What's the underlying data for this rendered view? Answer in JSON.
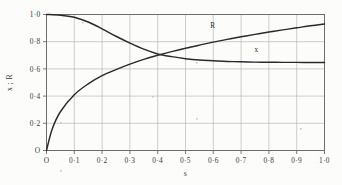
{
  "chart_data": {
    "type": "line",
    "title": "",
    "xlabel": "s",
    "ylabel": "x ; R",
    "xlim": [
      0,
      1.0
    ],
    "ylim": [
      0,
      1.0
    ],
    "grid": true,
    "legend": "inline-curve-labels",
    "x_tick_labels": [
      "O",
      "0·1",
      "0·2",
      "0·3",
      "0·4",
      "0·5",
      "0·6",
      "0·7",
      "0·8",
      "0·9",
      "1·0"
    ],
    "x_tick_values": [
      0,
      0.1,
      0.2,
      0.3,
      0.4,
      0.5,
      0.6,
      0.7,
      0.8,
      0.9,
      1.0
    ],
    "y_tick_labels": [
      "O",
      "0·2",
      "0·4",
      "0·6",
      "0·8",
      "1·0"
    ],
    "y_tick_values": [
      0,
      0.2,
      0.4,
      0.6,
      0.8,
      1.0
    ],
    "series": [
      {
        "name": "x",
        "label": "x",
        "label_x": 0.755,
        "label_y": 0.725,
        "x": [
          0.0,
          0.05,
          0.1,
          0.15,
          0.2,
          0.25,
          0.3,
          0.35,
          0.4,
          0.45,
          0.5,
          0.55,
          0.6,
          0.65,
          0.7,
          0.75,
          0.8,
          0.85,
          0.9,
          0.95,
          1.0
        ],
        "values": [
          1.0,
          0.995,
          0.98,
          0.945,
          0.895,
          0.84,
          0.79,
          0.745,
          0.71,
          0.69,
          0.675,
          0.665,
          0.66,
          0.655,
          0.652,
          0.65,
          0.649,
          0.648,
          0.648,
          0.647,
          0.647
        ]
      },
      {
        "name": "R",
        "label": "R",
        "label_x": 0.598,
        "label_y": 0.9,
        "x": [
          0.0,
          0.02,
          0.05,
          0.1,
          0.15,
          0.2,
          0.25,
          0.3,
          0.35,
          0.4,
          0.45,
          0.5,
          0.55,
          0.6,
          0.65,
          0.7,
          0.75,
          0.8,
          0.85,
          0.9,
          0.95,
          1.0
        ],
        "values": [
          0.0,
          0.155,
          0.285,
          0.41,
          0.49,
          0.55,
          0.595,
          0.635,
          0.67,
          0.7,
          0.727,
          0.752,
          0.775,
          0.797,
          0.817,
          0.836,
          0.854,
          0.871,
          0.887,
          0.902,
          0.917,
          0.93
        ]
      }
    ]
  },
  "colors": {
    "background": "#fcfcfa",
    "curve": "#2a2a2a",
    "grid": "#b9b9b4",
    "frame": "#6d6d6a",
    "text": "#3a3a3a"
  }
}
